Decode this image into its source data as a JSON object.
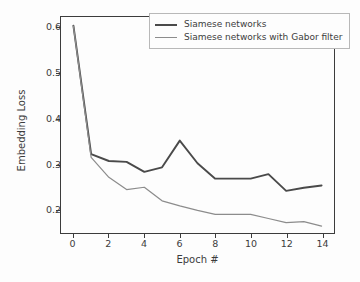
{
  "chart_data": {
    "type": "line",
    "title": "",
    "xlabel": "Epoch #",
    "ylabel": "Embedding Loss",
    "x": [
      0,
      1,
      2,
      3,
      4,
      5,
      6,
      7,
      8,
      9,
      10,
      11,
      12,
      13,
      14
    ],
    "xlim": [
      -0.7,
      14.7
    ],
    "ylim": [
      0.148,
      0.625
    ],
    "xticks": [
      0,
      2,
      4,
      6,
      8,
      10,
      12,
      14
    ],
    "xticklabels": [
      "0",
      "2",
      "4",
      "6",
      "8",
      "10",
      "12",
      "14"
    ],
    "yticks": [
      0.2,
      0.3,
      0.4,
      0.5,
      0.6
    ],
    "yticklabels": [
      "0.2",
      "0.3",
      "0.4",
      "0.5",
      "0.6"
    ],
    "grid": false,
    "legend_position": "upper right",
    "series": [
      {
        "name": "Siamese networks",
        "color": "#4a4a4a",
        "linewidth": 1.9,
        "values": [
          0.606,
          0.322,
          0.307,
          0.305,
          0.283,
          0.293,
          0.352,
          0.302,
          0.268,
          0.268,
          0.268,
          0.278,
          0.241,
          0.248,
          0.253
        ]
      },
      {
        "name": "Siamese networks with Gabor filter",
        "color": "#8c8c8c",
        "linewidth": 1.2,
        "values": [
          0.605,
          0.315,
          0.271,
          0.244,
          0.249,
          0.219,
          0.208,
          0.198,
          0.189,
          0.189,
          0.189,
          0.18,
          0.171,
          0.173,
          0.163
        ]
      }
    ]
  },
  "legend": {
    "entries": [
      {
        "label": "Siamese networks"
      },
      {
        "label": "Siamese networks with Gabor filter"
      }
    ]
  },
  "colors": {
    "series_dark": "#4a4a4a",
    "series_light": "#8c8c8c",
    "axis": "#3c3c3c",
    "background": "#fdfdfd"
  }
}
